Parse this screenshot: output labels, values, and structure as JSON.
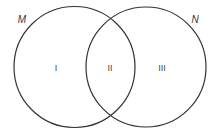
{
  "diagram": {
    "type": "venn",
    "sets": [
      {
        "name": "M",
        "cx": 74.5,
        "cy": 67,
        "r": 60.5,
        "label_x": 22,
        "label_y": 23
      },
      {
        "name": "N",
        "cx": 146,
        "cy": 67,
        "r": 60,
        "label_x": 195,
        "label_y": 23
      }
    ],
    "regions": [
      {
        "label": "I",
        "x": 56,
        "y": 71
      },
      {
        "label": "II",
        "x": 110,
        "y": 71
      },
      {
        "label": "III",
        "x": 162,
        "y": 71
      }
    ],
    "stroke_color": "#333333"
  }
}
